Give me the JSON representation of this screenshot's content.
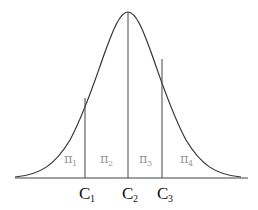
{
  "diagram": {
    "type": "normal-distribution-partition",
    "colors": {
      "curve": "#333333",
      "axis": "#444444",
      "region_labels": "#9a9a9a",
      "cut_labels": "#111111"
    },
    "regions": [
      {
        "symbol": "π",
        "subscript": "1",
        "x": 70
      },
      {
        "symbol": "π",
        "subscript": "2",
        "x": 106
      },
      {
        "symbol": "π",
        "subscript": "3",
        "x": 143
      },
      {
        "symbol": "π",
        "subscript": "4",
        "x": 185
      }
    ],
    "cutpoints": [
      {
        "letter": "C",
        "subscript": "1",
        "x": 85,
        "top": 98
      },
      {
        "letter": "C",
        "subscript": "2",
        "x": 128,
        "top": 12
      },
      {
        "letter": "C",
        "subscript": "3",
        "x": 162,
        "top": 59
      }
    ]
  }
}
